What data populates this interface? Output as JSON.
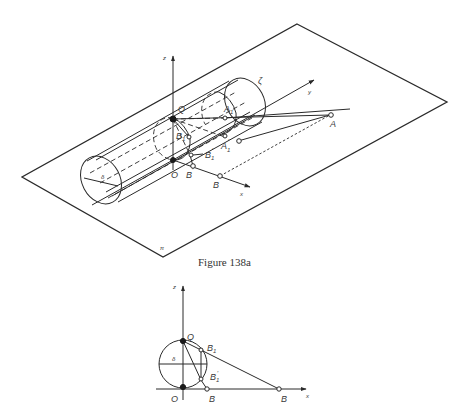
{
  "figure_a": {
    "caption": "Figure 138a",
    "labels": {
      "z": "z",
      "y": "y",
      "x": "x",
      "zeta": "ζ",
      "delta": "δ",
      "pi": "π",
      "Q": "Q",
      "O": "O",
      "A": "A",
      "A1": "A",
      "A1_sub": "1",
      "A1p": "A",
      "A1p_sub": "1",
      "A1p_prime": "′",
      "B1": "B",
      "B1_sub": "1",
      "B1p": "B",
      "B1p_sub": "1",
      "B1p_prime": "′",
      "Bp": "B",
      "Bp_prime": "′",
      "B": "B"
    }
  },
  "figure_b": {
    "labels": {
      "z": "z",
      "x": "x",
      "Q": "Q",
      "O": "O",
      "delta": "δ",
      "B1": "B",
      "B1_sub": "1",
      "B1p": "B",
      "B1p_sub": "1",
      "B1p_prime": "′",
      "Bp": "B",
      "B": "B"
    }
  },
  "colors": {
    "ink": "#2a2a2a",
    "background": "#ffffff"
  }
}
